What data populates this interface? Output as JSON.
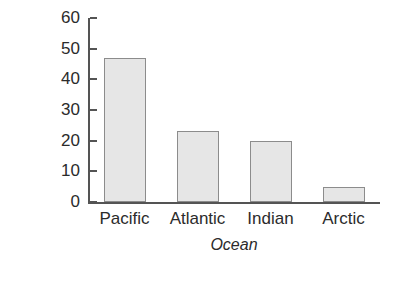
{
  "chart_data": {
    "type": "bar",
    "title": "",
    "subtitle": "",
    "categories": [
      "Pacific",
      "Atlantic",
      "Indian",
      "Arctic"
    ],
    "values": [
      47,
      23,
      20,
      5
    ],
    "xlabel": "Ocean",
    "ylabel": "Percentage",
    "ylim": [
      0,
      60
    ],
    "yticks": [
      0,
      10,
      20,
      30,
      40,
      50,
      60
    ],
    "ytick_labels": [
      "0",
      "10",
      "20",
      "30",
      "40",
      "50",
      "60"
    ],
    "grid": false,
    "legend": false,
    "legend_position": "none",
    "annotations": [],
    "series": [
      {
        "name": "Percentage",
        "values": [
          47,
          23,
          20,
          5
        ]
      }
    ],
    "colors": {
      "bar_fill": "#e6e6e6",
      "bar_border": "#8c8c8c",
      "axis": "#545454",
      "text": "#2b2b2b",
      "background": "#ffffff"
    }
  }
}
